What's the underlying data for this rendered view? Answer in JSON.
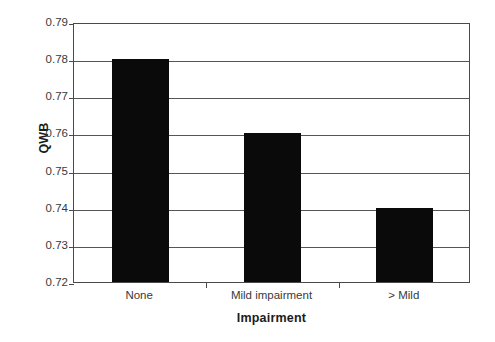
{
  "chart_data": {
    "type": "bar",
    "title": "",
    "subtitle": "",
    "categories": [
      "None",
      "Mild impairment",
      "> Mild"
    ],
    "values": [
      0.78,
      0.76,
      0.74
    ],
    "xlabel": "Impairment",
    "ylabel": "QWB",
    "ylim": [
      0.72,
      0.79
    ],
    "ytick_labels": [
      "0.79",
      "0.78",
      "0.77",
      "0.76",
      "0.75",
      "0.74",
      "0.73",
      "0.72"
    ],
    "ytick_values": [
      0.79,
      0.78,
      0.77,
      0.76,
      0.75,
      0.74,
      0.73,
      0.72
    ],
    "ytick_step": 0.01,
    "grid": "horizontal",
    "legend": "none",
    "bar_color": "#0a0a0a",
    "frame_color": "#4a4a4a",
    "gridline_color": "#55555a",
    "background_color": "#ffffff",
    "annotations": []
  }
}
